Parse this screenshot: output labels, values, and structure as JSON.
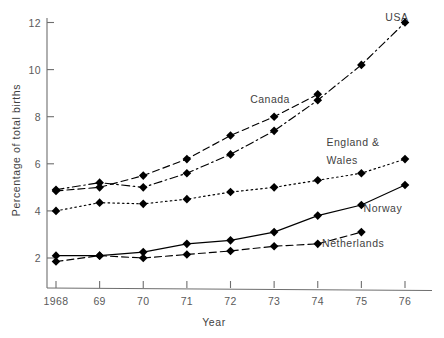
{
  "chart_data": {
    "type": "line",
    "title": "",
    "xlabel": "Year",
    "ylabel": "Percentage of total births",
    "x": [
      1968,
      1969,
      1970,
      1971,
      1972,
      1973,
      1974,
      1975,
      1976
    ],
    "xtick_labels": [
      "1968",
      "69",
      "70",
      "71",
      "72",
      "73",
      "74",
      "75",
      "76"
    ],
    "ytick_labels": [
      "2",
      "4",
      "6",
      "8",
      "10",
      "12"
    ],
    "ytick_values": [
      2,
      4,
      6,
      8,
      10,
      12
    ],
    "xlim": [
      1968,
      1976
    ],
    "ylim": [
      1.0,
      12.6
    ],
    "grid": false,
    "legend_position": "inline-annotations",
    "series": [
      {
        "name": "USA",
        "label": "USA",
        "style": "dash-dot",
        "marker": "filled-diamond",
        "x": [
          1968,
          1969,
          1970,
          1971,
          1972,
          1973,
          1974,
          1975,
          1976
        ],
        "values": [
          4.9,
          5.2,
          5.0,
          5.6,
          6.4,
          7.4,
          8.7,
          10.2,
          12.0
        ]
      },
      {
        "name": "Canada",
        "label": "Canada",
        "style": "dashed",
        "marker": "filled-diamond",
        "x": [
          1968,
          1969,
          1970,
          1971,
          1972,
          1973,
          1974
        ],
        "values": [
          4.85,
          5.0,
          5.5,
          6.2,
          7.2,
          8.0,
          8.95
        ]
      },
      {
        "name": "England & Wales",
        "label": "England &\nWales",
        "label_line1": "England &",
        "label_line2": "Wales",
        "style": "dotted",
        "marker": "filled-diamond",
        "x": [
          1968,
          1969,
          1970,
          1971,
          1972,
          1973,
          1974,
          1975,
          1976
        ],
        "values": [
          4.0,
          4.35,
          4.3,
          4.5,
          4.8,
          5.0,
          5.3,
          5.6,
          6.2
        ]
      },
      {
        "name": "Norway",
        "label": "Norway",
        "style": "solid",
        "marker": "filled-diamond",
        "x": [
          1968,
          1969,
          1970,
          1971,
          1972,
          1973,
          1974,
          1975,
          1976
        ],
        "values": [
          2.1,
          2.1,
          2.25,
          2.6,
          2.75,
          3.1,
          3.8,
          4.25,
          5.1
        ]
      },
      {
        "name": "Netherlands",
        "label": "Netherlands",
        "style": "dashed",
        "marker": "filled-diamond",
        "x": [
          1968,
          1969,
          1970,
          1971,
          1972,
          1973,
          1974,
          1975
        ],
        "values": [
          1.85,
          2.1,
          2.0,
          2.15,
          2.3,
          2.5,
          2.6,
          3.1
        ]
      }
    ],
    "annotations": [
      {
        "text": "USA",
        "x": 1975.55,
        "y": 12.05
      },
      {
        "text": "Canada",
        "x": 1972.45,
        "y": 8.6
      },
      {
        "text": "England &",
        "x": 1974.2,
        "y": 6.75
      },
      {
        "text": "Wales",
        "x": 1974.2,
        "y": 6.0
      },
      {
        "text": "Norway",
        "x": 1975.05,
        "y": 3.95
      },
      {
        "text": "Netherlands",
        "x": 1974.1,
        "y": 2.45
      }
    ],
    "colors": {
      "line": "#000000",
      "axis": "#6e6e6e",
      "text": "#3f3f3f",
      "tick_text": "#5a5a5a",
      "background": "#ffffff"
    }
  }
}
